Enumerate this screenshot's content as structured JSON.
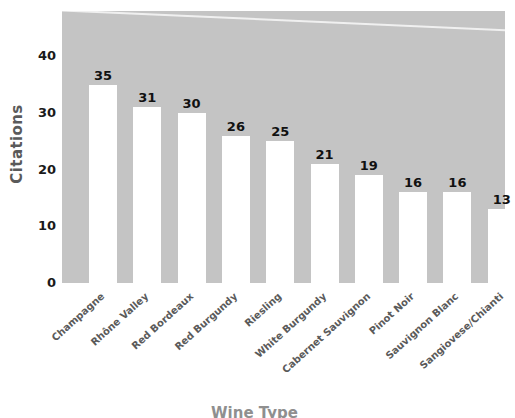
{
  "chart_data": {
    "type": "bar",
    "title": "",
    "xlabel": "Wine Type",
    "ylabel": "Citations",
    "categories": [
      "Champagne",
      "Rhône Valley",
      "Red Bordeaux",
      "Red Burgundy",
      "Riesling",
      "White Burgundy",
      "Cabernet Sauvignon",
      "Pinot Noir",
      "Sauvignon Blanc",
      "Sangiovese/Chianti"
    ],
    "values": [
      35,
      31,
      30,
      26,
      25,
      21,
      19,
      16,
      16,
      13
    ],
    "ylim": [
      0,
      48
    ],
    "yticks": [
      0,
      10,
      20,
      30,
      40
    ],
    "ytick_labels": [
      "0",
      "10",
      "20",
      "30",
      "40"
    ],
    "grid": false,
    "legend": null,
    "bar_color": "#ffffff",
    "plot_background": "#c4c4c4",
    "page_background": "#ffffff",
    "label_color": "#5a5a5a",
    "value_label_color": "#111111",
    "annotations": [
      "white diagonal scan line across upper plot area"
    ]
  },
  "axis": {
    "y_title": "Citations",
    "x_title": "Wine Type"
  }
}
